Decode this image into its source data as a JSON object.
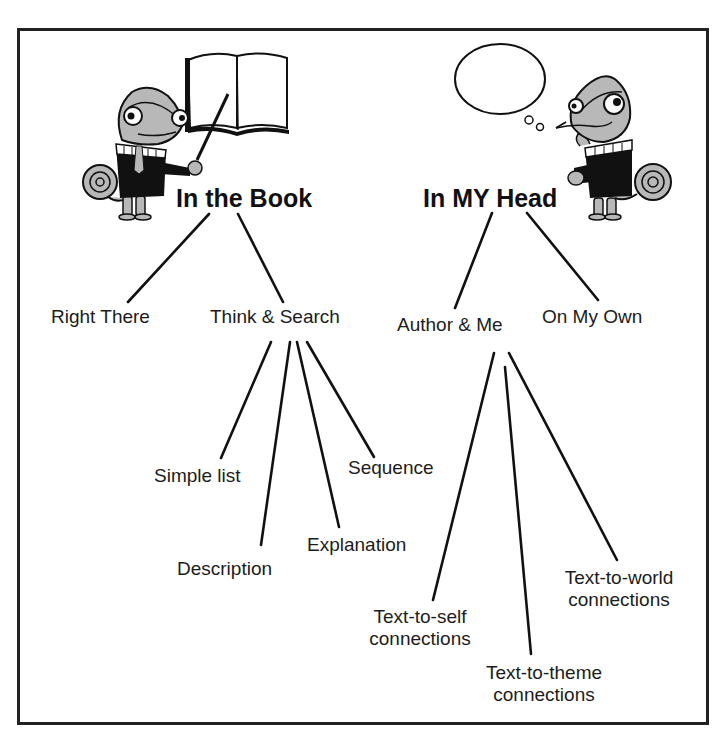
{
  "diagram": {
    "type": "tree",
    "frame": {
      "border_color": "#222222",
      "background": "#ffffff"
    },
    "branches": [
      {
        "id": "in-the-book",
        "label": "In the Book",
        "illustration": "chameleon-pointing-at-book",
        "children": [
          {
            "id": "right-there",
            "label": "Right There",
            "children": []
          },
          {
            "id": "think-and-search",
            "label": "Think & Search",
            "children": [
              {
                "id": "simple-list",
                "label": "Simple list"
              },
              {
                "id": "description",
                "label": "Description"
              },
              {
                "id": "explanation",
                "label": "Explanation"
              },
              {
                "id": "sequence",
                "label": "Sequence"
              }
            ]
          }
        ]
      },
      {
        "id": "in-my-head",
        "label": "In MY Head",
        "illustration": "chameleon-thinking-with-thought-bubble",
        "children": [
          {
            "id": "author-and-me",
            "label": "Author & Me",
            "children": [
              {
                "id": "text-to-self",
                "label_line1": "Text-to-self",
                "label_line2": "connections"
              },
              {
                "id": "text-to-theme",
                "label_line1": "Text-to-theme",
                "label_line2": "connections"
              },
              {
                "id": "text-to-world",
                "label_line1": "Text-to-world",
                "label_line2": "connections"
              }
            ]
          },
          {
            "id": "on-my-own",
            "label": "On My Own",
            "children": []
          }
        ]
      }
    ]
  },
  "colors": {
    "line": "#111111",
    "text": "#1c1c1c",
    "chameleon_skin": "#b8b8b8",
    "sweater": "#111111"
  }
}
